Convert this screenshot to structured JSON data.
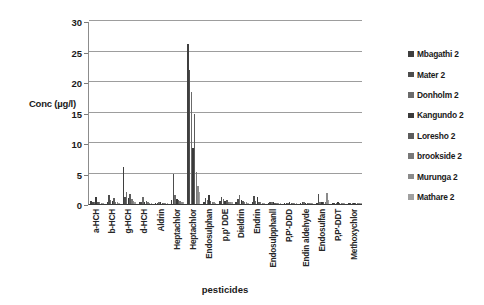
{
  "chart": {
    "type": "bar",
    "xlabel": "pesticides",
    "ylabel": "Conc (µg/l)"
  },
  "axis": {
    "y_ticks": [
      "0",
      "5",
      "10",
      "15",
      "20",
      "25",
      "30"
    ]
  },
  "chart_data": {
    "type": "bar",
    "title": "",
    "subtitle": "",
    "xlabel": "pesticides",
    "ylabel": "Conc (µg/l)",
    "ylim": [
      0,
      30
    ],
    "ytick_values": [
      0,
      5,
      10,
      15,
      20,
      25,
      30
    ],
    "grid": true,
    "legend_position": "right",
    "categories": [
      "a-HCH",
      "b-HCH",
      "g-HCH",
      "d-HCH",
      "Aldrin",
      "Heptachlor",
      "Heptachlor",
      "Endosulphan",
      "p,p' DDE",
      "Dieldrin",
      "Endrin",
      "Endosulpphanll",
      "P,P'-DDD",
      "Endin aldehyde",
      "Endosulfan",
      "P,P'-DDT",
      "Methoxychlor"
    ],
    "series": [
      {
        "name": "Mbagathi 2",
        "color": "#3f3f3f",
        "values": [
          0.5,
          0.4,
          6.0,
          0.3,
          0.2,
          0.6,
          26.3,
          0.3,
          0.5,
          0.4,
          0.3,
          0.2,
          0.2,
          0.2,
          0.2,
          0.2,
          0.1
        ]
      },
      {
        "name": "Mater 2",
        "color": "#4d4d4d",
        "values": [
          0.3,
          1.4,
          1.2,
          0.4,
          0.2,
          5.0,
          22.0,
          1.0,
          1.1,
          0.8,
          1.3,
          0.3,
          0.2,
          0.3,
          1.6,
          0.2,
          0.1
        ]
      },
      {
        "name": "Donholm 2",
        "color": "#6b6b6b",
        "values": [
          0.4,
          0.6,
          2.0,
          1.1,
          0.3,
          1.5,
          18.3,
          0.6,
          0.9,
          1.4,
          0.5,
          0.3,
          0.2,
          0.3,
          0.4,
          0.2,
          0.1
        ]
      },
      {
        "name": "Kangundo 2",
        "color": "#3a3a3a",
        "values": [
          1.1,
          0.5,
          1.0,
          0.4,
          0.3,
          0.9,
          9.2,
          1.5,
          0.5,
          0.6,
          1.2,
          0.3,
          0.3,
          0.2,
          0.3,
          0.3,
          0.1
        ]
      },
      {
        "name": "Loresho 2",
        "color": "#5c5c5c",
        "values": [
          0.3,
          1.0,
          1.6,
          0.5,
          0.2,
          0.7,
          14.8,
          0.5,
          0.7,
          0.5,
          0.4,
          0.2,
          0.2,
          0.2,
          0.3,
          0.2,
          0.1
        ]
      },
      {
        "name": "brookside 2",
        "color": "#787878",
        "values": [
          0.3,
          0.4,
          0.8,
          0.3,
          0.2,
          0.5,
          5.2,
          0.4,
          0.4,
          0.4,
          0.3,
          0.2,
          0.2,
          0.2,
          0.3,
          0.2,
          0.1
        ]
      },
      {
        "name": "Murunga 2",
        "color": "#8a8a8a",
        "values": [
          0.2,
          0.3,
          0.5,
          0.2,
          0.2,
          0.4,
          3.0,
          0.3,
          0.3,
          0.3,
          0.2,
          0.2,
          0.1,
          0.2,
          1.8,
          0.2,
          0.1
        ]
      },
      {
        "name": "Mathare 2",
        "color": "#a0a0a0",
        "values": [
          0.2,
          0.2,
          0.4,
          0.2,
          0.1,
          0.3,
          2.0,
          0.2,
          0.3,
          0.2,
          0.2,
          0.1,
          0.1,
          0.1,
          0.6,
          0.1,
          0.1
        ]
      }
    ]
  }
}
